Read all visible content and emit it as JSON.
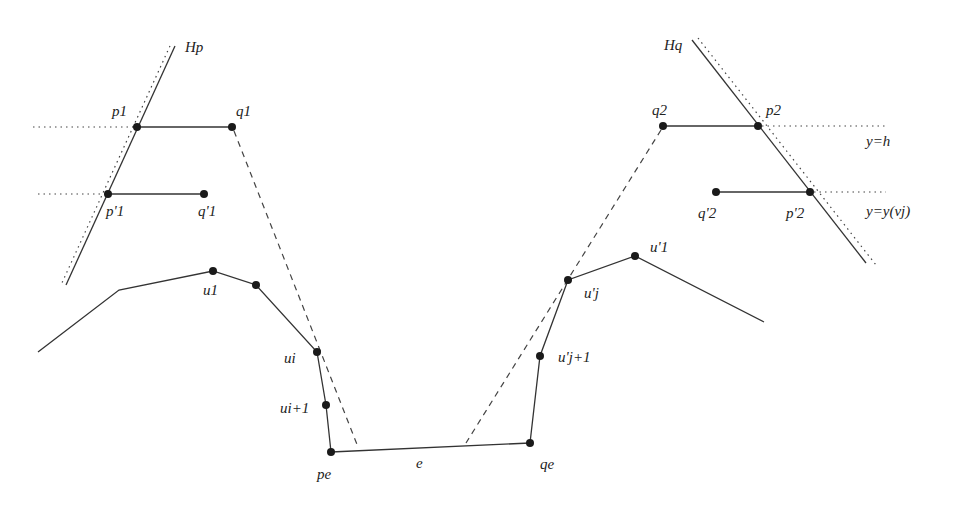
{
  "labels": {
    "Hp": "Hp",
    "Hq": "Hq",
    "p1": "p1",
    "q1": "q1",
    "p1prime": "p'1",
    "q1prime": "q'1",
    "u1": "u1",
    "ui": "ui",
    "ui_plus_1": "ui+1",
    "pe": "pe",
    "e": "e",
    "qe": "qe",
    "ujprime_plus_1": "u'j+1",
    "ujprime": "u'j",
    "u1prime": "u'1",
    "q2": "q2",
    "p2": "p2",
    "q2prime": "q'2",
    "p2prime": "p'2",
    "y_h": "y=h",
    "y_yvj": "y=y(vj)"
  },
  "colors": {
    "line": "#333333",
    "point": "#1a1a1a",
    "background": "#ffffff"
  }
}
